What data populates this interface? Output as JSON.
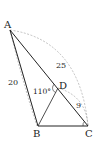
{
  "diagram": {
    "type": "geometry-triangle",
    "points": {
      "A": {
        "label": "A",
        "x": 10,
        "y": 30
      },
      "B": {
        "label": "B",
        "x": 38,
        "y": 126
      },
      "C": {
        "label": "C",
        "x": 88,
        "y": 126
      },
      "D": {
        "label": "D",
        "x": 58,
        "y": 88
      }
    },
    "segments": [
      "AB",
      "AC",
      "BC",
      "BD"
    ],
    "measurements": {
      "AB": "20",
      "AC": "25",
      "DC": "9",
      "angle_ADB": "110°"
    },
    "colors": {
      "line": "#222222",
      "dashed": "#999999"
    }
  }
}
